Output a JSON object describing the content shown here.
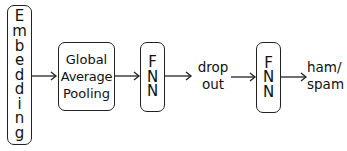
{
  "diagram": {
    "type": "flowchart",
    "direction": "left-to-right",
    "nodes": [
      {
        "id": "embedding",
        "label": "Embedding",
        "letters": [
          "E",
          "m",
          "b",
          "e",
          "d",
          "d",
          "i",
          "n",
          "g"
        ],
        "shape": "rounded-rect",
        "orientation": "vertical"
      },
      {
        "id": "gap",
        "label_lines": [
          "Global",
          "Average",
          "Pooling"
        ],
        "shape": "rounded-rect"
      },
      {
        "id": "fnn1",
        "label": "FNN",
        "letters": [
          "F",
          "N",
          "N"
        ],
        "shape": "rounded-rect",
        "orientation": "vertical"
      },
      {
        "id": "dropout",
        "label_lines": [
          "drop",
          "out"
        ],
        "shape": "text"
      },
      {
        "id": "fnn2",
        "label": "FNN",
        "letters": [
          "F",
          "N",
          "N"
        ],
        "shape": "rounded-rect",
        "orientation": "vertical"
      },
      {
        "id": "output",
        "label_lines": [
          "ham/",
          "spam"
        ],
        "shape": "text"
      }
    ],
    "edges": [
      {
        "from": "embedding",
        "to": "gap"
      },
      {
        "from": "gap",
        "to": "fnn1"
      },
      {
        "from": "fnn1",
        "to": "dropout"
      },
      {
        "from": "dropout",
        "to": "fnn2"
      },
      {
        "from": "fnn2",
        "to": "output"
      }
    ],
    "colors": {
      "stroke": "#222222",
      "text": "#111111",
      "background": "#ffffff"
    }
  }
}
